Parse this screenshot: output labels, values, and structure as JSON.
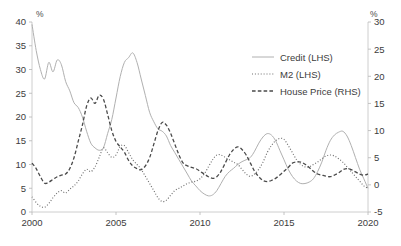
{
  "chart_data": {
    "type": "line",
    "title": "",
    "subtitle": "",
    "xlabel": "",
    "ylabel": "%",
    "ylabel_right": "%",
    "xlim": [
      2000,
      2020
    ],
    "ylim": [
      0,
      40
    ],
    "ylim_right": [
      -5,
      30
    ],
    "grid": false,
    "legend_position": "top-right",
    "x_ticks": [
      "2000",
      "2005",
      "2010",
      "2015",
      "2020"
    ],
    "x_tick_values": [
      2000,
      2005,
      2010,
      2015,
      2020
    ],
    "y_ticks_left": [
      "0",
      "5",
      "10",
      "15",
      "20",
      "25",
      "30",
      "35",
      "40"
    ],
    "y_tick_values_left": [
      0,
      5,
      10,
      15,
      20,
      25,
      30,
      35,
      40
    ],
    "y_ticks_right": [
      "-5",
      "0",
      "5",
      "10",
      "15",
      "20",
      "25",
      "30"
    ],
    "y_tick_values_right": [
      -5,
      0,
      5,
      10,
      15,
      20,
      25,
      30
    ],
    "series": [
      {
        "name": "Credit (LHS)",
        "axis": "left",
        "style": "solid",
        "color": "#b0b0b0",
        "x": [
          2000.0,
          2000.25,
          2000.5,
          2000.75,
          2001.0,
          2001.25,
          2001.5,
          2001.75,
          2002.0,
          2002.25,
          2002.5,
          2002.75,
          2003.0,
          2003.25,
          2003.5,
          2003.75,
          2004.0,
          2004.25,
          2004.5,
          2004.75,
          2005.0,
          2005.25,
          2005.5,
          2005.75,
          2006.0,
          2006.25,
          2006.5,
          2006.75,
          2007.0,
          2007.25,
          2007.5,
          2007.75,
          2008.0,
          2008.25,
          2008.5,
          2008.75,
          2009.0,
          2009.25,
          2009.5,
          2009.75,
          2010.0,
          2010.25,
          2010.5,
          2010.75,
          2011.0,
          2011.25,
          2011.5,
          2011.75,
          2012.0,
          2012.25,
          2012.5,
          2012.75,
          2013.0,
          2013.25,
          2013.5,
          2013.75,
          2014.0,
          2014.25,
          2014.5,
          2014.75,
          2015.0,
          2015.25,
          2015.5,
          2015.75,
          2016.0,
          2016.25,
          2016.5,
          2016.75,
          2017.0,
          2017.25,
          2017.5,
          2017.75,
          2018.0,
          2018.25,
          2018.5,
          2018.75,
          2019.0,
          2019.25,
          2019.5,
          2019.75,
          2020.0
        ],
        "values": [
          39.5,
          34.0,
          30.0,
          28.0,
          31.5,
          29.5,
          32.0,
          31.0,
          27.5,
          25.5,
          23.0,
          22.0,
          20.0,
          17.0,
          14.5,
          13.5,
          13.0,
          13.5,
          16.5,
          19.5,
          24.0,
          28.5,
          31.5,
          32.5,
          33.5,
          31.5,
          28.0,
          24.5,
          21.0,
          19.0,
          17.5,
          17.0,
          16.0,
          14.0,
          12.5,
          11.0,
          9.5,
          8.0,
          6.5,
          5.5,
          4.5,
          3.8,
          3.4,
          3.6,
          4.5,
          6.0,
          7.5,
          8.5,
          9.2,
          10.0,
          10.6,
          11.0,
          11.5,
          12.8,
          14.5,
          15.8,
          16.5,
          16.2,
          15.0,
          13.0,
          11.0,
          9.0,
          7.5,
          6.5,
          6.0,
          6.0,
          6.3,
          7.0,
          8.5,
          10.5,
          13.0,
          15.0,
          16.2,
          16.8,
          17.0,
          16.0,
          14.0,
          11.5,
          9.0,
          7.0,
          5.0
        ]
      },
      {
        "name": "M2 (LHS)",
        "axis": "left",
        "style": "dotted",
        "color": "#6e6e6e",
        "x": [
          2000.0,
          2000.25,
          2000.5,
          2000.75,
          2001.0,
          2001.25,
          2001.5,
          2001.75,
          2002.0,
          2002.25,
          2002.5,
          2002.75,
          2003.0,
          2003.25,
          2003.5,
          2003.75,
          2004.0,
          2004.25,
          2004.5,
          2004.75,
          2005.0,
          2005.25,
          2005.5,
          2005.75,
          2006.0,
          2006.25,
          2006.5,
          2006.75,
          2007.0,
          2007.25,
          2007.5,
          2007.75,
          2008.0,
          2008.25,
          2008.5,
          2008.75,
          2009.0,
          2009.25,
          2009.5,
          2009.75,
          2010.0,
          2010.25,
          2010.5,
          2010.75,
          2011.0,
          2011.25,
          2011.5,
          2011.75,
          2012.0,
          2012.25,
          2012.5,
          2012.75,
          2013.0,
          2013.25,
          2013.5,
          2013.75,
          2014.0,
          2014.25,
          2014.5,
          2014.75,
          2015.0,
          2015.25,
          2015.5,
          2015.75,
          2016.0,
          2016.25,
          2016.5,
          2016.75,
          2017.0,
          2017.25,
          2017.5,
          2017.75,
          2018.0,
          2018.25,
          2018.5,
          2018.75,
          2019.0,
          2019.25,
          2019.5,
          2019.75,
          2020.0
        ],
        "values": [
          3.2,
          2.0,
          1.2,
          1.0,
          1.8,
          3.0,
          4.0,
          4.5,
          4.0,
          4.8,
          5.5,
          6.5,
          8.0,
          9.0,
          8.5,
          9.5,
          11.5,
          13.5,
          12.5,
          11.5,
          12.0,
          13.8,
          14.0,
          12.5,
          11.0,
          10.0,
          9.0,
          7.5,
          6.0,
          4.5,
          3.0,
          2.2,
          2.5,
          3.5,
          4.5,
          5.0,
          5.5,
          6.0,
          6.3,
          6.5,
          7.0,
          8.0,
          9.5,
          11.0,
          12.0,
          12.0,
          11.5,
          11.0,
          10.5,
          10.0,
          9.0,
          8.0,
          7.5,
          8.0,
          9.0,
          10.5,
          12.5,
          14.0,
          15.0,
          15.5,
          15.3,
          14.0,
          12.5,
          11.0,
          10.0,
          9.5,
          9.5,
          10.0,
          10.5,
          11.2,
          11.8,
          12.0,
          11.8,
          11.2,
          10.5,
          9.5,
          8.5,
          7.5,
          6.5,
          5.5,
          5.0
        ]
      },
      {
        "name": "House Price (RHS)",
        "axis": "right",
        "style": "dashed",
        "color": "#4a4a4a",
        "x": [
          2000.0,
          2000.25,
          2000.5,
          2000.75,
          2001.0,
          2001.25,
          2001.5,
          2001.75,
          2002.0,
          2002.25,
          2002.5,
          2002.75,
          2003.0,
          2003.25,
          2003.5,
          2003.75,
          2004.0,
          2004.25,
          2004.5,
          2004.75,
          2005.0,
          2005.25,
          2005.5,
          2005.75,
          2006.0,
          2006.25,
          2006.5,
          2006.75,
          2007.0,
          2007.25,
          2007.5,
          2007.75,
          2008.0,
          2008.25,
          2008.5,
          2008.75,
          2009.0,
          2009.25,
          2009.5,
          2009.75,
          2010.0,
          2010.25,
          2010.5,
          2010.75,
          2011.0,
          2011.25,
          2011.5,
          2011.75,
          2012.0,
          2012.25,
          2012.5,
          2012.75,
          2013.0,
          2013.25,
          2013.5,
          2013.75,
          2014.0,
          2014.25,
          2014.5,
          2014.75,
          2015.0,
          2015.25,
          2015.5,
          2015.75,
          2016.0,
          2016.25,
          2016.5,
          2016.75,
          2017.0,
          2017.25,
          2017.5,
          2017.75,
          2018.0,
          2018.25,
          2018.5,
          2018.75,
          2019.0,
          2019.25,
          2019.5,
          2019.75,
          2020.0
        ],
        "values": [
          4.0,
          3.0,
          1.5,
          0.3,
          0.5,
          1.0,
          1.5,
          1.8,
          2.0,
          3.0,
          5.0,
          8.0,
          11.0,
          14.5,
          16.0,
          15.0,
          16.5,
          15.8,
          13.0,
          10.0,
          8.0,
          7.0,
          6.0,
          4.5,
          3.5,
          3.0,
          2.8,
          3.5,
          5.0,
          7.5,
          10.0,
          11.5,
          11.0,
          9.5,
          7.5,
          5.5,
          4.0,
          3.5,
          3.2,
          3.0,
          2.5,
          2.0,
          1.5,
          1.2,
          1.5,
          2.5,
          4.0,
          5.5,
          6.5,
          7.0,
          6.5,
          5.5,
          4.0,
          2.5,
          1.5,
          0.8,
          0.6,
          0.8,
          1.2,
          1.8,
          2.5,
          3.2,
          4.0,
          4.2,
          4.2,
          3.8,
          3.2,
          2.5,
          2.0,
          1.8,
          1.6,
          1.5,
          1.8,
          2.2,
          2.8,
          3.0,
          2.8,
          2.4,
          2.0,
          1.8,
          2.0
        ]
      }
    ]
  },
  "legend": {
    "items": [
      {
        "label": "Credit (LHS)",
        "style": "solid",
        "color": "#b0b0b0"
      },
      {
        "label": "M2 (LHS)",
        "style": "dotted",
        "color": "#6e6e6e"
      },
      {
        "label": "House Price (RHS)",
        "style": "dashed",
        "color": "#4a4a4a"
      }
    ]
  },
  "axes": {
    "left_unit": "%",
    "right_unit": "%"
  }
}
